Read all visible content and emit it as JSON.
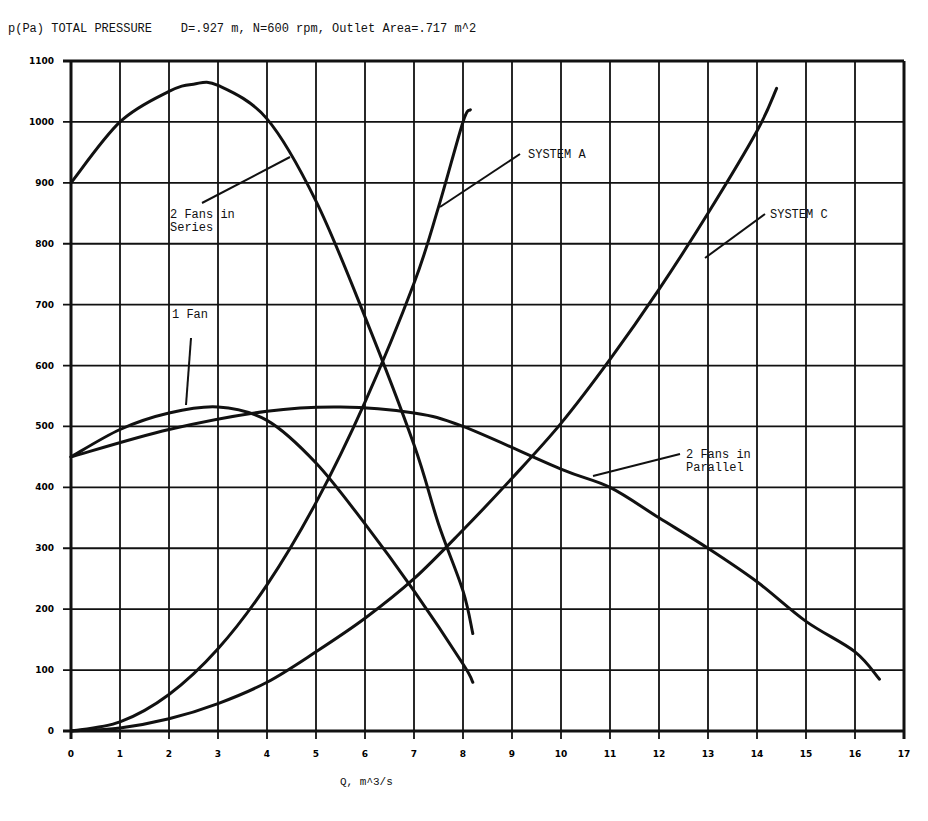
{
  "chart_data": {
    "type": "line",
    "title": "p(Pa) TOTAL PRESSURE    D=.927 m, N=600 rpm, Outlet Area=.717 m^2",
    "xlabel": "Q, m^3/s",
    "ylabel": "p(Pa) TOTAL PRESSURE",
    "xlim": [
      0,
      17
    ],
    "ylim": [
      0,
      1100
    ],
    "grid": true,
    "x_ticks": [
      0,
      1,
      2,
      3,
      4,
      5,
      6,
      7,
      8,
      9,
      10,
      11,
      12,
      13,
      14,
      15,
      16,
      17
    ],
    "y_ticks": [
      0,
      100,
      200,
      300,
      400,
      500,
      600,
      700,
      800,
      900,
      1000,
      1100
    ],
    "series": [
      {
        "name": "1 Fan",
        "points": [
          [
            0,
            450
          ],
          [
            1,
            495
          ],
          [
            2,
            522
          ],
          [
            3,
            532
          ],
          [
            4,
            510
          ],
          [
            5,
            440
          ],
          [
            6,
            340
          ],
          [
            7,
            230
          ],
          [
            8,
            110
          ],
          [
            8.2,
            80
          ]
        ]
      },
      {
        "name": "2 Fans in Series",
        "points": [
          [
            0,
            900
          ],
          [
            1,
            1000
          ],
          [
            2,
            1050
          ],
          [
            2.5,
            1062
          ],
          [
            3,
            1060
          ],
          [
            4,
            1005
          ],
          [
            5,
            870
          ],
          [
            6,
            680
          ],
          [
            7,
            470
          ],
          [
            7.5,
            340
          ],
          [
            8,
            230
          ],
          [
            8.2,
            160
          ]
        ]
      },
      {
        "name": "2 Fans in Parallel",
        "points": [
          [
            0,
            450
          ],
          [
            2,
            495
          ],
          [
            4,
            525
          ],
          [
            5.5,
            532
          ],
          [
            7,
            522
          ],
          [
            8,
            500
          ],
          [
            10,
            430
          ],
          [
            11,
            400
          ],
          [
            12,
            350
          ],
          [
            13,
            300
          ],
          [
            14,
            245
          ],
          [
            15,
            180
          ],
          [
            16,
            130
          ],
          [
            16.5,
            85
          ]
        ]
      },
      {
        "name": "SYSTEM A",
        "points": [
          [
            0,
            0
          ],
          [
            1,
            15
          ],
          [
            2,
            60
          ],
          [
            3,
            135
          ],
          [
            4,
            240
          ],
          [
            5,
            375
          ],
          [
            6,
            540
          ],
          [
            7,
            735
          ],
          [
            7.5,
            860
          ],
          [
            8,
            1000
          ],
          [
            8.15,
            1020
          ]
        ]
      },
      {
        "name": "SYSTEM C",
        "points": [
          [
            0,
            0
          ],
          [
            1,
            5
          ],
          [
            2,
            20
          ],
          [
            3,
            45
          ],
          [
            4,
            80
          ],
          [
            5,
            130
          ],
          [
            6,
            185
          ],
          [
            7,
            250
          ],
          [
            8,
            330
          ],
          [
            9,
            415
          ],
          [
            10,
            505
          ],
          [
            11,
            610
          ],
          [
            12,
            725
          ],
          [
            13,
            850
          ],
          [
            14,
            985
          ],
          [
            14.4,
            1055
          ]
        ]
      }
    ],
    "annotations": [
      {
        "text": [
          "2 Fans in",
          "Series"
        ],
        "label_at": [
          170,
          218
        ],
        "leader": [
          [
            202,
            203
          ],
          [
            290,
            157
          ]
        ]
      },
      {
        "text": [
          "SYSTEM A"
        ],
        "label_at": [
          528,
          158
        ],
        "leader": [
          [
            440,
            207
          ],
          [
            520,
            154
          ]
        ]
      },
      {
        "text": [
          "SYSTEM C"
        ],
        "label_at": [
          770,
          218
        ],
        "leader": [
          [
            705,
            258
          ],
          [
            765,
            214
          ]
        ]
      },
      {
        "text": [
          "1 Fan"
        ],
        "label_at": [
          172,
          318
        ],
        "leader": [
          [
            191,
            338
          ],
          [
            186,
            405
          ]
        ]
      },
      {
        "text": [
          "2 Fans in",
          "Parallel"
        ],
        "label_at": [
          686,
          458
        ],
        "leader": [
          [
            593,
            476
          ],
          [
            680,
            454
          ]
        ]
      }
    ]
  }
}
